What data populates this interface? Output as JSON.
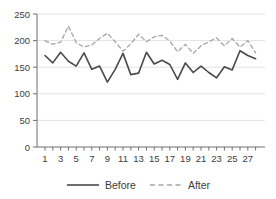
{
  "chart_data": {
    "type": "line",
    "x": [
      1,
      2,
      3,
      4,
      5,
      6,
      7,
      8,
      9,
      10,
      11,
      12,
      13,
      14,
      15,
      16,
      17,
      18,
      19,
      20,
      21,
      22,
      23,
      24,
      25,
      26,
      27,
      28
    ],
    "series": [
      {
        "name": "Before",
        "style": "solid",
        "color": "#4a4a4a",
        "values": [
          172,
          158,
          178,
          161,
          152,
          177,
          146,
          152,
          122,
          146,
          176,
          136,
          139,
          178,
          156,
          163,
          155,
          127,
          158,
          140,
          152,
          140,
          130,
          151,
          145,
          181,
          172,
          166
        ]
      },
      {
        "name": "After",
        "style": "dashed",
        "color": "#a6a6a6",
        "values": [
          200,
          193,
          197,
          227,
          196,
          188,
          192,
          204,
          214,
          198,
          180,
          194,
          212,
          198,
          207,
          210,
          199,
          179,
          193,
          176,
          190,
          198,
          205,
          190,
          204,
          188,
          200,
          177
        ]
      }
    ],
    "title": "",
    "xlabel": "",
    "ylabel": "",
    "ylim": [
      0,
      250
    ],
    "xlim": [
      1,
      28
    ],
    "yticks": [
      0,
      50,
      100,
      150,
      200,
      250
    ],
    "xticks_minor_every": 1,
    "xtick_labels": [
      "1",
      "3",
      "5",
      "7",
      "9",
      "11",
      "13",
      "15",
      "17",
      "19",
      "21",
      "23",
      "25",
      "27"
    ],
    "xtick_label_positions": [
      1,
      3,
      5,
      7,
      9,
      11,
      13,
      15,
      17,
      19,
      21,
      23,
      25,
      27
    ],
    "grid": "horizontal",
    "grid_color": "#e3e3e3",
    "axis_color": "#6e6e6e",
    "tick_text_color": "#3d3d3d",
    "legend_position": "bottom-center",
    "legend": [
      {
        "label": "Before",
        "line": "solid"
      },
      {
        "label": "After",
        "line": "dashed"
      }
    ]
  }
}
